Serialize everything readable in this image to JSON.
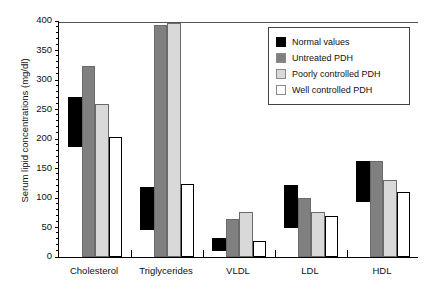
{
  "chart_data": {
    "type": "bar",
    "title": "",
    "subtitle": "",
    "xlabel": "",
    "ylabel": "Serum lipid concentrations (mg/dl)",
    "ylim": [
      0,
      400
    ],
    "ytick_step": 50,
    "yticks": [
      "0",
      "50",
      "100",
      "150",
      "200",
      "250",
      "300",
      "350",
      "400"
    ],
    "grid": false,
    "legend_position": "top-right",
    "categories": [
      "Cholesterol",
      "Triglycerides",
      "VLDL",
      "LDL",
      "HDL"
    ],
    "series": [
      {
        "name": "Normal values",
        "color": "#000000",
        "type": "range",
        "note": "reference range drawn as floating bar from low to high",
        "low": [
          186,
          45,
          10,
          50,
          93
        ],
        "high": [
          272,
          118,
          32,
          122,
          163
        ],
        "values": [
          272,
          118,
          32,
          122,
          163
        ]
      },
      {
        "name": "Untreated PDH",
        "color": "#808080",
        "type": "bar",
        "values": [
          323,
          393,
          64,
          100,
          163
        ]
      },
      {
        "name": "Poorly controlled PDH",
        "color": "#d9d9d9",
        "type": "bar",
        "values": [
          259,
          397,
          76,
          77,
          130
        ]
      },
      {
        "name": "Well controlled PDH",
        "color": "#ffffff",
        "type": "bar",
        "values": [
          203,
          123,
          27,
          70,
          110
        ]
      }
    ]
  },
  "legend": {
    "items": [
      {
        "label": "Normal values",
        "color": "#000000"
      },
      {
        "label": "Untreated PDH",
        "color": "#808080"
      },
      {
        "label": "Poorly controlled PDH",
        "color": "#d9d9d9"
      },
      {
        "label": "Well controlled PDH",
        "color": "#ffffff"
      }
    ]
  }
}
